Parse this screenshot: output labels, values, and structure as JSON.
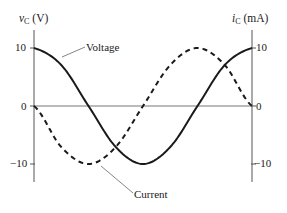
{
  "chart_data": {
    "type": "line",
    "title": "",
    "ylabel_left": {
      "symbol": "v",
      "subscript": "C",
      "unit": "(V)"
    },
    "ylabel_right": {
      "symbol": "i",
      "subscript": "C",
      "unit": "(mA)"
    },
    "xlabel": "",
    "ylim": [
      -10,
      10
    ],
    "left_ticks": [
      "10",
      "0",
      "−10"
    ],
    "right_ticks": [
      "10",
      "0",
      "−10"
    ],
    "tick_values": [
      10,
      0,
      -10
    ],
    "grid": false,
    "x": [
      0,
      0.125,
      0.25,
      0.375,
      0.5,
      0.625,
      0.75,
      0.875,
      1.0
    ],
    "x_unit": "fraction of one period",
    "series": [
      {
        "name": "Voltage",
        "style": "solid",
        "axis": "left",
        "values": [
          10,
          7.07,
          0,
          -7.07,
          -10,
          -7.07,
          0,
          7.07,
          10
        ]
      },
      {
        "name": "Current",
        "style": "dashed",
        "axis": "right",
        "values": [
          0,
          -7.07,
          -10,
          -7.07,
          0,
          7.07,
          10,
          7.07,
          0
        ]
      }
    ],
    "annotations": [
      {
        "text": "Voltage",
        "points_to": "Voltage"
      },
      {
        "text": "Current",
        "points_to": "Current"
      }
    ]
  }
}
